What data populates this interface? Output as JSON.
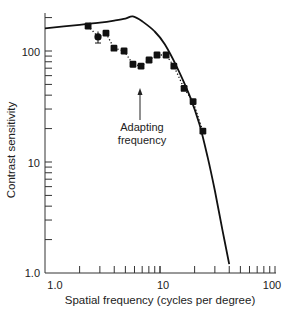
{
  "chart_data": {
    "type": "line",
    "title": "",
    "xlabel": "Spatial frequency (cycles per degree)",
    "ylabel": "Contrast sensitivity",
    "xscale": "log",
    "yscale": "log",
    "xlim": [
      1.0,
      100
    ],
    "ylim": [
      1.0,
      220
    ],
    "x_tick_labels": [
      "1.0",
      "10",
      "100"
    ],
    "y_tick_labels": [
      "1.0",
      "10",
      "100"
    ],
    "grid": false,
    "legend": null,
    "series": [
      {
        "name": "Unadapted contrast sensitivity function",
        "style": "solid line",
        "x": [
          1.0,
          2.0,
          3.0,
          4.0,
          5.0,
          5.8,
          7.0,
          9.0,
          11.0,
          14.0,
          18.0,
          22.0,
          26.0,
          30.0,
          35.0,
          40.0
        ],
        "y": [
          160,
          172,
          180,
          188,
          196,
          205,
          185,
          150,
          115,
          72,
          40,
          22,
          11,
          5.5,
          2.4,
          1.2
        ]
      },
      {
        "name": "Sensitivity after adaptation",
        "style": "markers with dotted line",
        "x": [
          2.37,
          2.89,
          3.39,
          3.98,
          4.87,
          5.82,
          6.84,
          8.03,
          9.42,
          11.3,
          13.2,
          16.2,
          19.4,
          23.6
        ],
        "y": [
          168,
          134,
          145,
          106,
          100,
          76,
          73,
          83,
          92,
          92,
          73,
          46,
          35,
          19
        ],
        "error_bars": [
          {
            "index": 1,
            "low": 118,
            "high": 150
          }
        ]
      }
    ],
    "annotations": [
      {
        "text": "Adapting\nfrequency",
        "arrow_to_x": 6.8,
        "arrow_to_y": 48
      }
    ]
  },
  "annotation": {
    "line1": "Adapting",
    "line2": "frequency"
  },
  "axes": {
    "xlabel": "Spatial frequency (cycles per degree)",
    "ylabel": "Contrast sensitivity",
    "x_ticks": [
      {
        "value": 1,
        "label": "1.0"
      },
      {
        "value": 10,
        "label": "10"
      },
      {
        "value": 100,
        "label": "100"
      }
    ],
    "y_ticks": [
      {
        "value": 1,
        "label": "1.0"
      },
      {
        "value": 10,
        "label": "10"
      },
      {
        "value": 100,
        "label": "100"
      }
    ]
  },
  "colors": {
    "line": "#111111",
    "marker": "#111111",
    "axis": "#333333",
    "text": "#222222"
  }
}
